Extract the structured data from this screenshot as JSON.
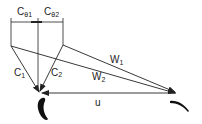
{
  "diagram": {
    "labels": {
      "c_theta1": "C",
      "c_theta1_sub": "θ1",
      "c_theta2": "C",
      "c_theta2_sub": "θ2",
      "c1": "C",
      "c1_sub": "1",
      "c2": "C",
      "c2_sub": "2",
      "w1": "W",
      "w1_sub": "1",
      "w2": "W",
      "w2_sub": "2",
      "u": "u"
    },
    "colors": {
      "line": "#222222",
      "background": "#ffffff"
    }
  }
}
